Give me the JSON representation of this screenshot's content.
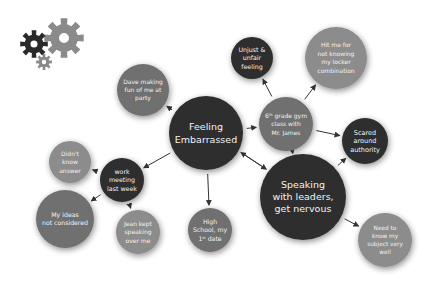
{
  "diagram": {
    "type": "mind-map",
    "colors": {
      "dark": "#2e2e2e",
      "mid": "#6f6f6f",
      "light": "#8c8c8c",
      "edge": "#333333",
      "text": "#f2f2f2",
      "gear_dark": "#2a2a2a",
      "gear_light": "#8a8a8a"
    },
    "nodes": [
      {
        "id": "feeling",
        "lines": [
          "Feeling",
          "Embarrassed"
        ],
        "tone": "dark"
      },
      {
        "id": "speaking",
        "lines": [
          "Speaking",
          "with leaders,",
          "get nervous"
        ],
        "tone": "dark"
      },
      {
        "id": "dave",
        "lines": [
          "Dave making",
          "fun of me at",
          "party"
        ],
        "tone": "mid"
      },
      {
        "id": "unjust",
        "lines": [
          "Unjust &",
          "unfair",
          "feeling"
        ],
        "tone": "dark"
      },
      {
        "id": "hitme",
        "lines": [
          "Hit me for",
          "not knowing",
          "my locker",
          "combination"
        ],
        "tone": "light"
      },
      {
        "id": "gym",
        "lines": [
          "6th grade gym",
          "class with",
          "Mr. James"
        ],
        "tone": "mid"
      },
      {
        "id": "scared",
        "lines": [
          "Scared",
          "around",
          "authority"
        ],
        "tone": "dark"
      },
      {
        "id": "needto",
        "lines": [
          "Need to",
          "know my",
          "subject very",
          "well"
        ],
        "tone": "light"
      },
      {
        "id": "didnt",
        "lines": [
          "Didn't",
          "know",
          "answer"
        ],
        "tone": "light"
      },
      {
        "id": "work",
        "lines": [
          "work",
          "meeting",
          "last week"
        ],
        "tone": "dark"
      },
      {
        "id": "myideas",
        "lines": [
          "My ideas",
          "not considered"
        ],
        "tone": "mid"
      },
      {
        "id": "jean",
        "lines": [
          "Jean kept",
          "speaking",
          "over me"
        ],
        "tone": "light"
      },
      {
        "id": "highschool",
        "lines": [
          "High",
          "School, my",
          "1st date"
        ],
        "tone": "mid"
      }
    ],
    "edges": [
      {
        "from": "feeling",
        "to": "dave"
      },
      {
        "from": "feeling",
        "to": "gym"
      },
      {
        "from": "feeling",
        "to": "work"
      },
      {
        "from": "feeling",
        "to": "highschool"
      },
      {
        "from": "feeling",
        "to": "speaking"
      },
      {
        "from": "speaking",
        "to": "feeling"
      },
      {
        "from": "gym",
        "to": "unjust"
      },
      {
        "from": "gym",
        "to": "hitme"
      },
      {
        "from": "gym",
        "to": "scared"
      },
      {
        "from": "speaking",
        "to": "gym"
      },
      {
        "from": "speaking",
        "to": "scared"
      },
      {
        "from": "speaking",
        "to": "needto"
      },
      {
        "from": "work",
        "to": "didnt"
      },
      {
        "from": "work",
        "to": "myideas"
      },
      {
        "from": "work",
        "to": "jean"
      }
    ],
    "logo_icon": "gears-icon"
  }
}
